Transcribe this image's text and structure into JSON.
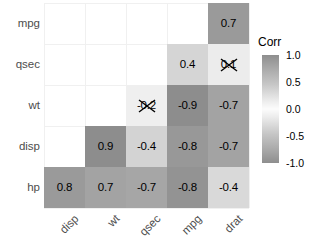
{
  "chart_data": {
    "type": "heatmap",
    "title": "",
    "xlabel": "",
    "ylabel": "",
    "legend_title": "Corr",
    "legend_position": "right",
    "grid": true,
    "color_scale": {
      "low": "#8e8e8e",
      "mid": "#fcfcfc",
      "high": "#8e8e8e",
      "range": [
        -1.0,
        1.0
      ]
    },
    "legend_ticks": [
      "1.0",
      "0.5",
      "0.0",
      "-0.5",
      "-1.0"
    ],
    "legend_tick_values": [
      1.0,
      0.5,
      0.0,
      -0.5,
      -1.0
    ],
    "x_categories": [
      "disp",
      "wt",
      "qsec",
      "mpg",
      "drat"
    ],
    "y_categories": [
      "mpg",
      "qsec",
      "wt",
      "disp",
      "hp"
    ],
    "cells": [
      {
        "row": "mpg",
        "col": "drat",
        "value": 0.7,
        "label": "0.7",
        "significant": true,
        "color": "#9a9a9a"
      },
      {
        "row": "qsec",
        "col": "mpg",
        "value": 0.4,
        "label": "0.4",
        "significant": true,
        "color": "#d5d5d5"
      },
      {
        "row": "qsec",
        "col": "drat",
        "value": 0.1,
        "label": "0.1",
        "significant": false,
        "color": "#ececec"
      },
      {
        "row": "wt",
        "col": "qsec",
        "value": -0.2,
        "label": "-0.2",
        "significant": false,
        "color": "#efefef"
      },
      {
        "row": "wt",
        "col": "mpg",
        "value": -0.9,
        "label": "-0.9",
        "significant": true,
        "color": "#8d8d8d"
      },
      {
        "row": "wt",
        "col": "drat",
        "value": -0.7,
        "label": "-0.7",
        "significant": true,
        "color": "#a3a3a3"
      },
      {
        "row": "disp",
        "col": "wt",
        "value": 0.9,
        "label": "0.9",
        "significant": true,
        "color": "#8d8d8d"
      },
      {
        "row": "disp",
        "col": "qsec",
        "value": -0.4,
        "label": "-0.4",
        "significant": true,
        "color": "#d3d3d3"
      },
      {
        "row": "disp",
        "col": "mpg",
        "value": -0.8,
        "label": "-0.8",
        "significant": true,
        "color": "#989898"
      },
      {
        "row": "disp",
        "col": "drat",
        "value": -0.7,
        "label": "-0.7",
        "significant": true,
        "color": "#a3a3a3"
      },
      {
        "row": "hp",
        "col": "disp",
        "value": 0.8,
        "label": "0.8",
        "significant": true,
        "color": "#9a9a9a"
      },
      {
        "row": "hp",
        "col": "wt",
        "value": 0.7,
        "label": "0.7",
        "significant": true,
        "color": "#a3a3a3"
      },
      {
        "row": "hp",
        "col": "qsec",
        "value": -0.7,
        "label": "-0.7",
        "significant": true,
        "color": "#a6a6a6"
      },
      {
        "row": "hp",
        "col": "mpg",
        "value": -0.8,
        "label": "-0.8",
        "significant": true,
        "color": "#939393"
      },
      {
        "row": "hp",
        "col": "drat",
        "value": -0.4,
        "label": "-0.4",
        "significant": true,
        "color": "#d9d9d9"
      }
    ]
  }
}
